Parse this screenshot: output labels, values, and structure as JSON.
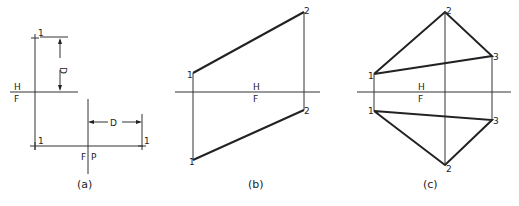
{
  "figure": {
    "panels": [
      {
        "id": "a",
        "caption": "(a)",
        "labels": {
          "h": "H",
          "f": "F",
          "fold_f": "F",
          "fold_p": "P",
          "dim_top": "D",
          "dim_right": "D",
          "point_top": "1",
          "point_bottom_left": "1",
          "point_bottom_right": "1"
        }
      },
      {
        "id": "b",
        "caption": "(b)",
        "labels": {
          "h": "H",
          "f": "F",
          "p1_top": "1",
          "p1_bottom": "1",
          "p2_top": "2",
          "p2_bottom": "2"
        }
      },
      {
        "id": "c",
        "caption": "(c)",
        "labels": {
          "h": "H",
          "f": "F",
          "p1_top": "1",
          "p1_bottom": "1",
          "p2_top": "2",
          "p2_bottom": "2",
          "p3_top": "3",
          "p3_bottom": "3"
        }
      }
    ]
  }
}
